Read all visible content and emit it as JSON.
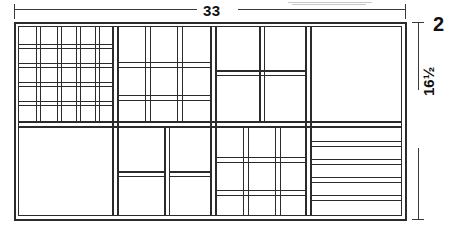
{
  "drawing": {
    "title": "Compartmented tray / drawer organizer plan",
    "view": "top plan view",
    "stroke_color": "#2b2b2b",
    "background_color": "#ffffff",
    "canvas": {
      "width": 454,
      "height": 239
    }
  },
  "dimensions": {
    "width": {
      "value": "33",
      "name": "overall-width",
      "orientation": "horizontal",
      "position": "top"
    },
    "height": {
      "value": "16½",
      "name": "overall-height",
      "orientation": "vertical",
      "position": "right"
    },
    "depth": {
      "value": "2",
      "name": "depth",
      "orientation": "vertical",
      "position": "top-right"
    }
  },
  "layout": {
    "outer_frame": {
      "x": 14,
      "y": 22,
      "width": 392,
      "height": 198,
      "wall": 4
    },
    "major_columns": [
      115,
      213,
      308
    ],
    "major_row": 124,
    "sections": [
      {
        "name": "top-left-fine-grid",
        "region": [
          18,
          26,
          97,
          98
        ],
        "type": "grid",
        "rows": 5,
        "cols": 5,
        "cell_count": 25
      },
      {
        "name": "top-second-medium-grid",
        "region": [
          119,
          26,
          94,
          98
        ],
        "type": "grid",
        "rows": 3,
        "cols": 3,
        "cell_count": 9
      },
      {
        "name": "top-third-quad",
        "region": [
          217,
          26,
          91,
          98
        ],
        "type": "grid",
        "rows": 2,
        "cols": 2,
        "cell_count": 4
      },
      {
        "name": "top-right-large-open",
        "region": [
          312,
          26,
          90,
          98
        ],
        "type": "single",
        "rows": 1,
        "cols": 1,
        "cell_count": 1
      },
      {
        "name": "bottom-left-large-open",
        "region": [
          18,
          128,
          97,
          88
        ],
        "type": "single",
        "rows": 1,
        "cols": 1,
        "cell_count": 1
      },
      {
        "name": "bottom-second-pair",
        "region": [
          119,
          128,
          94,
          88
        ],
        "type": "grid",
        "rows": 2,
        "cols": 2,
        "cell_count": 4,
        "note": "split rows offset between columns"
      },
      {
        "name": "bottom-third-grid",
        "region": [
          217,
          128,
          91,
          88
        ],
        "type": "grid",
        "rows": 3,
        "cols": 3,
        "cell_count": 9
      },
      {
        "name": "bottom-right-strips",
        "region": [
          312,
          128,
          90,
          88
        ],
        "type": "strips",
        "rows": 5,
        "cols": 1,
        "cell_count": 5
      }
    ]
  },
  "annotations": {
    "extension_lines": "true",
    "arrow_style": "plain tick"
  }
}
